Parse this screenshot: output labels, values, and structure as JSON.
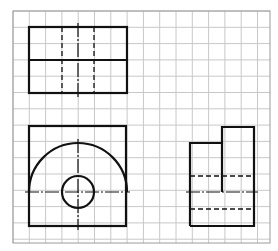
{
  "diagram": {
    "type": "orthographic-projection-drawing",
    "grid": {
      "left": 13,
      "top": 11,
      "right": 270,
      "bottom": 243,
      "cell": 16.3,
      "line_color": "#c8c8c8",
      "border_color": "#9a9a9a"
    },
    "stroke_color": "#111111",
    "views": {
      "top_view": {
        "rect": {
          "x": 29,
          "y": 27,
          "w": 98,
          "h": 66
        },
        "mid_line_y": 60,
        "hidden_lines_x": [
          62,
          94
        ],
        "center_line_x": 78
      },
      "front_view": {
        "rect": {
          "x": 29,
          "y": 126,
          "w": 97,
          "h": 100
        },
        "arc": {
          "cx": 78,
          "cy": 192,
          "r": 49
        },
        "circle": {
          "cx": 78,
          "cy": 192,
          "r": 16
        },
        "center_line_y": 192,
        "center_line_x": 78
      },
      "side_view": {
        "outline": [
          [
            190,
            226
          ],
          [
            190,
            143
          ],
          [
            222,
            143
          ],
          [
            222,
            127
          ],
          [
            254,
            127
          ],
          [
            254,
            226
          ],
          [
            190,
            226
          ]
        ],
        "step_line": {
          "x": 222,
          "y1": 143,
          "y2": 192
        },
        "hidden_lines_y": [
          176,
          209
        ],
        "center_line_y": 192
      }
    }
  }
}
